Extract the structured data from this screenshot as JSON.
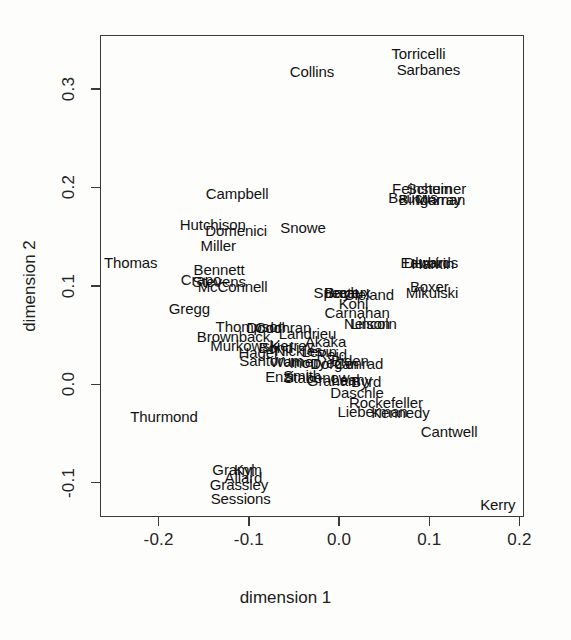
{
  "chart_data": {
    "type": "scatter",
    "title": "",
    "xlabel": "dimension 1",
    "ylabel": "dimension 2",
    "xlim": [
      -0.265,
      0.205
    ],
    "ylim": [
      -0.135,
      0.355
    ],
    "xticks": [
      -0.2,
      -0.1,
      0.0,
      0.1,
      0.2
    ],
    "xticklabels": [
      "-0.2",
      "-0.1",
      "0.0",
      "0.1",
      "0.2"
    ],
    "yticks": [
      -0.1,
      0.0,
      0.1,
      0.2,
      0.3
    ],
    "yticklabels": [
      "-0.1",
      "0.0",
      "0.1",
      "0.2",
      "0.3"
    ],
    "grid": false,
    "legend": false,
    "marker": "text-label",
    "points": [
      {
        "label": "Torricelli",
        "x": 0.088,
        "y": 0.337
      },
      {
        "label": "Sarbanes",
        "x": 0.099,
        "y": 0.32
      },
      {
        "label": "Collins",
        "x": -0.03,
        "y": 0.318
      },
      {
        "label": "Feinstein",
        "x": 0.092,
        "y": 0.199
      },
      {
        "label": "Schumer",
        "x": 0.108,
        "y": 0.199
      },
      {
        "label": "Baucus",
        "x": 0.082,
        "y": 0.19
      },
      {
        "label": "Bingaman",
        "x": 0.103,
        "y": 0.188
      },
      {
        "label": "Murray",
        "x": 0.11,
        "y": 0.188
      },
      {
        "label": "Campbell",
        "x": -0.113,
        "y": 0.194
      },
      {
        "label": "Hutchison",
        "x": -0.14,
        "y": 0.163
      },
      {
        "label": "Domenici",
        "x": -0.114,
        "y": 0.157
      },
      {
        "label": "Snowe",
        "x": -0.04,
        "y": 0.16
      },
      {
        "label": "Miller",
        "x": -0.134,
        "y": 0.142
      },
      {
        "label": "Thomas",
        "x": -0.231,
        "y": 0.124
      },
      {
        "label": "Edwards",
        "x": 0.1,
        "y": 0.124
      },
      {
        "label": "Durbin",
        "x": 0.096,
        "y": 0.124
      },
      {
        "label": "Harkin",
        "x": 0.104,
        "y": 0.123
      },
      {
        "label": "Bennett",
        "x": -0.133,
        "y": 0.117
      },
      {
        "label": "Crapo",
        "x": -0.153,
        "y": 0.107
      },
      {
        "label": "Stevens",
        "x": -0.133,
        "y": 0.105
      },
      {
        "label": "McConnell",
        "x": -0.118,
        "y": 0.1
      },
      {
        "label": "Boxer",
        "x": 0.1,
        "y": 0.1
      },
      {
        "label": "Mikulski",
        "x": 0.103,
        "y": 0.094
      },
      {
        "label": "Specter",
        "x": 0.0,
        "y": 0.094
      },
      {
        "label": "Breaux",
        "x": 0.009,
        "y": 0.094
      },
      {
        "label": "Bayh",
        "x": 0.003,
        "y": 0.094
      },
      {
        "label": "Cleland",
        "x": 0.033,
        "y": 0.092
      },
      {
        "label": "Gregg",
        "x": -0.166,
        "y": 0.077
      },
      {
        "label": "Kohl",
        "x": 0.016,
        "y": 0.083
      },
      {
        "label": "Carnahan",
        "x": 0.02,
        "y": 0.073
      },
      {
        "label": "Nelson",
        "x": 0.031,
        "y": 0.062
      },
      {
        "label": "Lincoln",
        "x": 0.038,
        "y": 0.062
      },
      {
        "label": "Thompson",
        "x": -0.098,
        "y": 0.059
      },
      {
        "label": "Dodd",
        "x": -0.083,
        "y": 0.058
      },
      {
        "label": "Cochran",
        "x": -0.062,
        "y": 0.058
      },
      {
        "label": "Brownback",
        "x": -0.117,
        "y": 0.049
      },
      {
        "label": "Landrieu",
        "x": -0.035,
        "y": 0.052
      },
      {
        "label": "Murkowski",
        "x": -0.104,
        "y": 0.04
      },
      {
        "label": "Hagel",
        "x": -0.09,
        "y": 0.033
      },
      {
        "label": "Akaka",
        "x": -0.015,
        "y": 0.044
      },
      {
        "label": "Kerrey",
        "x": -0.052,
        "y": 0.04
      },
      {
        "label": "Bond",
        "x": -0.07,
        "y": 0.038
      },
      {
        "label": "Nickles",
        "x": -0.045,
        "y": 0.035
      },
      {
        "label": "Levin",
        "x": -0.022,
        "y": 0.034
      },
      {
        "label": "Reid",
        "x": -0.008,
        "y": 0.031
      },
      {
        "label": "Santorum",
        "x": -0.075,
        "y": 0.025
      },
      {
        "label": "Warner",
        "x": -0.05,
        "y": 0.024
      },
      {
        "label": "Inouye",
        "x": -0.03,
        "y": 0.023
      },
      {
        "label": "Dorgan",
        "x": -0.005,
        "y": 0.022
      },
      {
        "label": "Biden",
        "x": 0.012,
        "y": 0.025
      },
      {
        "label": "Conrad",
        "x": 0.022,
        "y": 0.022
      },
      {
        "label": "Enzi",
        "x": -0.066,
        "y": 0.008
      },
      {
        "label": "Smith",
        "x": -0.041,
        "y": 0.009
      },
      {
        "label": "Stabenow",
        "x": -0.025,
        "y": 0.007
      },
      {
        "label": "Graham",
        "x": -0.006,
        "y": 0.004
      },
      {
        "label": "Leahy",
        "x": 0.014,
        "y": 0.005
      },
      {
        "label": "Byrd",
        "x": 0.03,
        "y": 0.003
      },
      {
        "label": "Daschle",
        "x": 0.02,
        "y": -0.008
      },
      {
        "label": "Rockefeller",
        "x": 0.052,
        "y": -0.018
      },
      {
        "label": "Lieberman",
        "x": 0.037,
        "y": -0.027
      },
      {
        "label": "Kennedy",
        "x": 0.068,
        "y": -0.028
      },
      {
        "label": "Cantwell",
        "x": 0.122,
        "y": -0.048
      },
      {
        "label": "Thurmond",
        "x": -0.194,
        "y": -0.032
      },
      {
        "label": "Gramm",
        "x": -0.113,
        "y": -0.086
      },
      {
        "label": "Kyl",
        "x": -0.105,
        "y": -0.086
      },
      {
        "label": "Allard",
        "x": -0.106,
        "y": -0.094
      },
      {
        "label": "Grassley",
        "x": -0.111,
        "y": -0.101
      },
      {
        "label": "Sessions",
        "x": -0.109,
        "y": -0.116
      },
      {
        "label": "Kerry",
        "x": 0.176,
        "y": -0.122
      }
    ]
  },
  "axes": {
    "xlabel": "dimension 1",
    "ylabel": "dimension 2"
  }
}
